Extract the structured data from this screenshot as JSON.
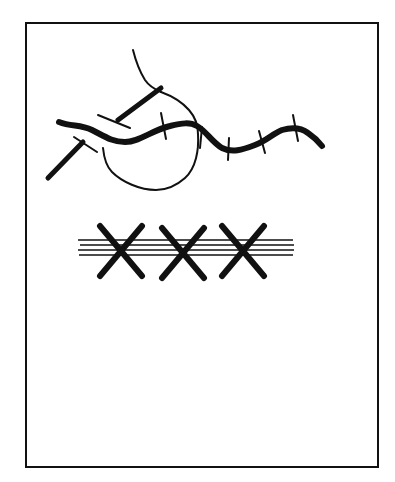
{
  "diagram": {
    "background": "#ffffff",
    "ink": "#111111",
    "frame": {
      "x": 26,
      "y": 23,
      "width": 352,
      "height": 444,
      "stroke_width": 2
    },
    "river": {
      "stroke_width": 6,
      "path": "M59,122 C72,127 80,124 92,130 C104,136 112,142 125,142 C140,142 152,130 170,126 C182,123 190,122 197,126 C206,131 212,142 222,148 C232,153 242,150 255,145 C268,140 272,134 282,130 C292,127 300,127 308,133 C314,137 318,141 322,146",
      "crossings": [
        {
          "name": "crossing-1",
          "x1": 161,
          "y1": 113,
          "x2": 166,
          "y2": 139
        },
        {
          "name": "crossing-2",
          "x1": 202,
          "y1": 127,
          "x2": 200,
          "y2": 148
        },
        {
          "name": "crossing-3",
          "x1": 229,
          "y1": 138,
          "x2": 228,
          "y2": 160
        },
        {
          "name": "crossing-4",
          "x1": 259,
          "y1": 131,
          "x2": 265,
          "y2": 153
        },
        {
          "name": "crossing-5",
          "x1": 293,
          "y1": 115,
          "x2": 298,
          "y2": 141
        }
      ]
    },
    "roads": [
      {
        "name": "upper-road",
        "x1": 161,
        "y1": 88,
        "x2": 118,
        "y2": 120,
        "stroke_width": 5,
        "cap": {
          "x1": 98,
          "y1": 115,
          "x2": 130,
          "y2": 128
        }
      },
      {
        "name": "lower-road",
        "x1": 83,
        "y1": 142,
        "x2": 48,
        "y2": 178,
        "stroke_width": 5,
        "cap": {
          "x1": 74,
          "y1": 137,
          "x2": 97,
          "y2": 152
        }
      }
    ],
    "thin_paths": [
      {
        "name": "north-track",
        "path": "M133,50 C136,62 140,72 145,80 C149,86 154,89 161,92",
        "stroke_width": 2
      },
      {
        "name": "loop-path",
        "path": "M161,92 C172,96 182,102 189,110 C196,118 198,126 198,134 C199,150 196,168 185,178 C176,186 166,190 156,190 C140,190 122,182 112,172 C106,166 104,158 103,148",
        "stroke_width": 2
      }
    ],
    "hatched_band": {
      "lines": [
        {
          "x1": 78,
          "y1": 240,
          "x2": 293,
          "y2": 240
        },
        {
          "x1": 80,
          "y1": 245,
          "x2": 294,
          "y2": 245
        },
        {
          "x1": 78,
          "y1": 250,
          "x2": 294,
          "y2": 250
        },
        {
          "x1": 79,
          "y1": 255,
          "x2": 293,
          "y2": 255
        }
      ],
      "line_width": 1.5,
      "x_marks": [
        {
          "name": "x-mark-1",
          "cx": 121,
          "cy": 251,
          "half_w": 21,
          "half_h": 25
        },
        {
          "name": "x-mark-2",
          "cx": 183,
          "cy": 253,
          "half_w": 21,
          "half_h": 25
        },
        {
          "name": "x-mark-3",
          "cx": 243,
          "cy": 251,
          "half_w": 21,
          "half_h": 25
        }
      ],
      "x_stroke_width": 6
    }
  }
}
